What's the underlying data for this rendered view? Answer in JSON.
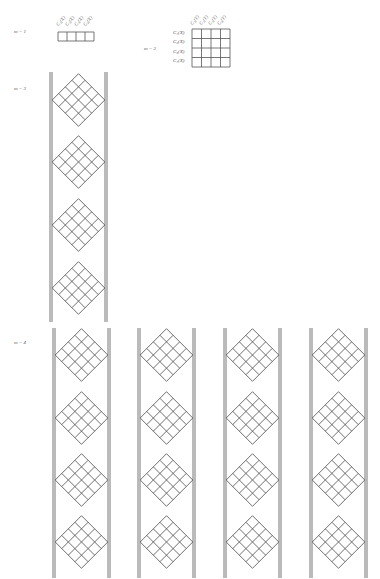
{
  "figure": {
    "sections": [
      {
        "id": "m1",
        "label": "m = 1"
      },
      {
        "id": "m2",
        "label": "m = 2"
      },
      {
        "id": "m3",
        "label": "m = 3"
      },
      {
        "id": "m4",
        "label": "m = 4"
      }
    ],
    "m1_table": {
      "col_headers": [
        "C₁(X)",
        "C₂(X)",
        "C₃(X)",
        "C₄(X)"
      ],
      "rows": 1,
      "cols": 4
    },
    "m2_table": {
      "col_headers": [
        "C₁(Y)",
        "C₂(Y)",
        "C₃(Y)",
        "C₄(Y)"
      ],
      "row_headers": [
        "C₁(X)",
        "C₂(X)",
        "C₃(X)",
        "C₄(X)"
      ],
      "rows": 4,
      "cols": 4
    },
    "m3_panel": {
      "columns": 1,
      "diamonds_per_column": 4,
      "grid_size": 4
    },
    "m4_panel": {
      "columns": 4,
      "diamonds_per_column": 4,
      "grid_size": 4
    },
    "colors": {
      "line": "#555555",
      "bar": "#777777",
      "background": "#ffffff"
    }
  }
}
